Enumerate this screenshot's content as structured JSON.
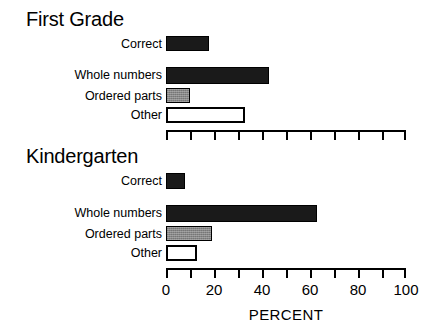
{
  "chart_data": {
    "type": "bar",
    "orientation": "horizontal",
    "title": "",
    "xlabel": "PERCENT",
    "ylabel": "",
    "xlim": [
      0,
      100
    ],
    "xticks": [
      0,
      10,
      20,
      30,
      40,
      50,
      60,
      70,
      80,
      90,
      100
    ],
    "xtick_labels": [
      "0",
      "",
      "20",
      "",
      "40",
      "",
      "60",
      "",
      "80",
      "",
      "100"
    ],
    "grid": false,
    "legend": "none",
    "panels": [
      {
        "title": "First Grade",
        "axis_labeled": false,
        "groups": [
          {
            "categories": [
              "Correct"
            ],
            "values": [
              18
            ],
            "styles": [
              "solid"
            ]
          },
          {
            "categories": [
              "Whole numbers",
              "Ordered parts",
              "Other"
            ],
            "values": [
              43,
              10,
              33
            ],
            "styles": [
              "solid",
              "gray",
              "open"
            ]
          }
        ]
      },
      {
        "title": "Kindergarten",
        "axis_labeled": true,
        "groups": [
          {
            "categories": [
              "Correct"
            ],
            "values": [
              8
            ],
            "styles": [
              "solid"
            ]
          },
          {
            "categories": [
              "Whole numbers",
              "Ordered parts",
              "Other"
            ],
            "values": [
              63,
              19,
              13
            ],
            "styles": [
              "solid",
              "gray",
              "open"
            ]
          }
        ]
      }
    ],
    "series_style_colors": {
      "solid": "#1a1a1a",
      "gray": "#868686",
      "open": "#ffffff"
    }
  },
  "labels": {
    "first_grade_title": "First Grade",
    "kindergarten_title": "Kindergarten",
    "correct": "Correct",
    "whole_numbers": "Whole numbers",
    "ordered_parts": "Ordered parts",
    "other": "Other",
    "percent": "PERCENT",
    "tick_0": "0",
    "tick_20": "20",
    "tick_40": "40",
    "tick_60": "60",
    "tick_80": "80",
    "tick_100": "100"
  }
}
